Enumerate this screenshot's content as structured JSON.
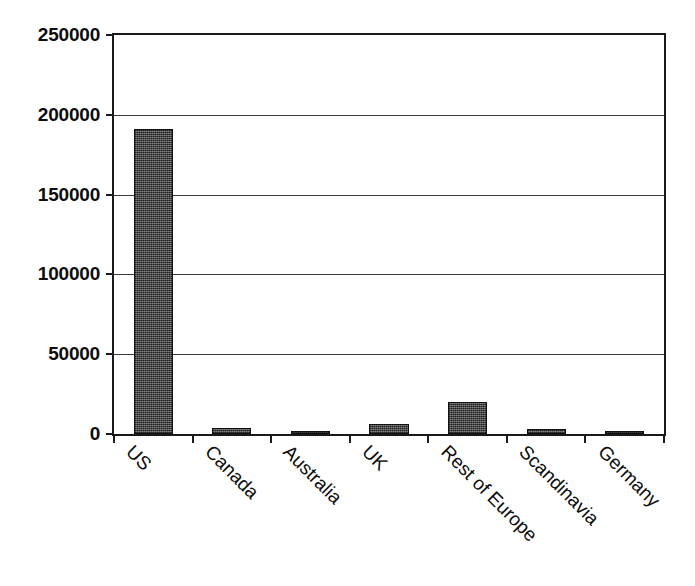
{
  "chart_data": {
    "type": "bar",
    "title": "",
    "subtitle": "",
    "xlabel": "",
    "ylabel": "",
    "categories": [
      "US",
      "Canada",
      "Australia",
      "UK",
      "Rest of Europe",
      "Scandinavia",
      "Germany"
    ],
    "values": [
      191000,
      3500,
      1200,
      6000,
      20000,
      3200,
      2200
    ],
    "ylim": [
      0,
      250000
    ],
    "y_ticks": [
      0,
      50000,
      100000,
      150000,
      200000,
      250000
    ],
    "y_tick_labels": [
      "0",
      "50000",
      "100000",
      "150000",
      "200000",
      "250000"
    ],
    "grid": "horizontal",
    "legend": "none",
    "x_tick_label_rotation": 45,
    "bar_fill_color": "#4f4f4f",
    "bar_border_color": "#111111",
    "axis_color": "#1a1a1a",
    "gridline_color": "#3a3a3a",
    "background_color": "#ffffff",
    "annotations": []
  }
}
